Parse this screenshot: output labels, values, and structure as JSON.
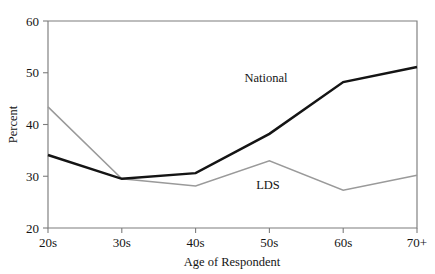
{
  "chart_data": {
    "type": "line",
    "title": "",
    "subtitle": "",
    "xlabel": "Age of Respondent",
    "ylabel": "Percent",
    "categories": [
      "20s",
      "30s",
      "40s",
      "50s",
      "60s",
      "70+"
    ],
    "ylim": [
      20,
      60
    ],
    "yticks": [
      20,
      30,
      40,
      50,
      60
    ],
    "ytick_labels": [
      "20",
      "30",
      "40",
      "50",
      "60"
    ],
    "grid": false,
    "legend_position": "inline-annotations",
    "series": [
      {
        "name": "National",
        "color": "#141414",
        "line_width": 2.5,
        "values": [
          34.1,
          29.5,
          30.6,
          38.2,
          48.2,
          51.1
        ]
      },
      {
        "name": "LDS",
        "color": "#9a9a9a",
        "line_width": 1.5,
        "values": [
          43.4,
          29.5,
          28.1,
          33.0,
          27.3,
          30.2
        ]
      }
    ],
    "annotations": [
      {
        "text": "National",
        "x_px": 266,
        "y_px": 82
      },
      {
        "text": "LDS",
        "x_px": 268,
        "y_px": 189
      }
    ]
  },
  "axes": {
    "y_tick_0": "20",
    "y_tick_1": "30",
    "y_tick_2": "40",
    "y_tick_3": "50",
    "y_tick_4": "60",
    "x_tick_0": "20s",
    "x_tick_1": "30s",
    "x_tick_2": "40s",
    "x_tick_3": "50s",
    "x_tick_4": "60s",
    "x_tick_5": "70+",
    "x_title": "Age of Respondent",
    "y_title": "Percent"
  },
  "labels": {
    "national": "National",
    "lds": "LDS"
  }
}
